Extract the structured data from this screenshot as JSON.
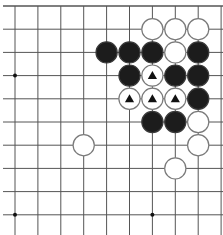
{
  "board": {
    "background": "#ffffff",
    "line_color": "#555555",
    "grid": {
      "origin_x": 15,
      "origin_y": 6,
      "step_x": 22.9,
      "step_y": 23.2,
      "cols": 10,
      "rows": 10,
      "edges": {
        "top": true,
        "left": false,
        "right": false,
        "bottom": false
      }
    },
    "hoshi": [
      {
        "col": 0,
        "row": 3
      },
      {
        "col": 0,
        "row": 9
      },
      {
        "col": 6,
        "row": 9
      }
    ],
    "stones": [
      {
        "col": 6,
        "row": 1,
        "color": "white"
      },
      {
        "col": 7,
        "row": 1,
        "color": "white"
      },
      {
        "col": 8,
        "row": 1,
        "color": "white"
      },
      {
        "col": 4,
        "row": 2,
        "color": "black"
      },
      {
        "col": 5,
        "row": 2,
        "color": "black"
      },
      {
        "col": 6,
        "row": 2,
        "color": "black"
      },
      {
        "col": 7,
        "row": 2,
        "color": "white"
      },
      {
        "col": 8,
        "row": 2,
        "color": "black"
      },
      {
        "col": 5,
        "row": 3,
        "color": "black"
      },
      {
        "col": 6,
        "row": 3,
        "color": "white",
        "mark": "triangle"
      },
      {
        "col": 7,
        "row": 3,
        "color": "black"
      },
      {
        "col": 8,
        "row": 3,
        "color": "black"
      },
      {
        "col": 5,
        "row": 4,
        "color": "white",
        "mark": "triangle"
      },
      {
        "col": 6,
        "row": 4,
        "color": "white",
        "mark": "triangle"
      },
      {
        "col": 7,
        "row": 4,
        "color": "white",
        "mark": "triangle"
      },
      {
        "col": 8,
        "row": 4,
        "color": "black"
      },
      {
        "col": 6,
        "row": 5,
        "color": "black"
      },
      {
        "col": 7,
        "row": 5,
        "color": "black"
      },
      {
        "col": 8,
        "row": 5,
        "color": "white"
      },
      {
        "col": 3,
        "row": 6,
        "color": "white"
      },
      {
        "col": 8,
        "row": 6,
        "color": "white"
      },
      {
        "col": 7,
        "row": 7,
        "color": "white"
      }
    ],
    "colors": {
      "black_stone": "#1c1c1c",
      "black_outline": "#3a3a3a",
      "white_stone": "#ffffff",
      "white_outline": "#7a7a7a",
      "mark": "#111111"
    }
  }
}
